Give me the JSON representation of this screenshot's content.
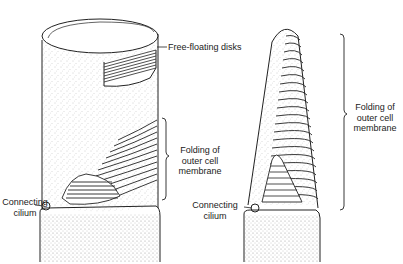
{
  "figure": {
    "colors": {
      "ink": "#222222",
      "stipple": "#9a9a9a",
      "background": "#ffffff"
    }
  },
  "rod": {
    "labels": {
      "disks": "Free-floating disks",
      "folding_line1": "Folding of",
      "folding_line2": "outer cell",
      "folding_line3": "membrane",
      "cilium_line1": "Connecting",
      "cilium_line2": "cilium"
    }
  },
  "cone": {
    "labels": {
      "folding_line1": "Folding of",
      "folding_line2": "outer cell",
      "folding_line3": "membrane",
      "cilium_line1": "Connecting",
      "cilium_line2": "cilium"
    }
  }
}
